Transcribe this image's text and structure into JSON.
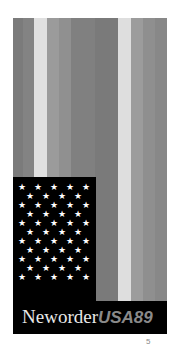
{
  "cover": {
    "title_primary": "Neworder",
    "title_secondary": "USA89",
    "page_number": "5",
    "colors": {
      "canton": "#000000",
      "star": "#ffffff",
      "band": "#000000",
      "title_primary": "#e8e8e8",
      "title_secondary": "#8a8a8a"
    },
    "stripes": [
      {
        "name": "stripe-1",
        "color": "#7b7b7b"
      },
      {
        "name": "stripe-2",
        "color": "#838383"
      },
      {
        "name": "stripe-3",
        "color": "#e0e0e0"
      },
      {
        "name": "stripe-4",
        "color": "#9b9b9b"
      },
      {
        "name": "stripe-5",
        "color": "#909090"
      },
      {
        "name": "stripe-6",
        "color": "#808080"
      },
      {
        "name": "stripe-7",
        "color": "#7a7a7a"
      },
      {
        "name": "stripe-8",
        "color": "#dedede"
      },
      {
        "name": "stripe-9",
        "color": "#9c9c9c"
      },
      {
        "name": "stripe-10",
        "color": "#8f8f8f"
      },
      {
        "name": "stripe-11",
        "color": "#888888"
      }
    ],
    "star_glyph": "★",
    "star_rows": [
      5,
      4,
      5,
      4,
      5,
      4,
      5,
      4,
      5,
      4,
      5
    ]
  }
}
